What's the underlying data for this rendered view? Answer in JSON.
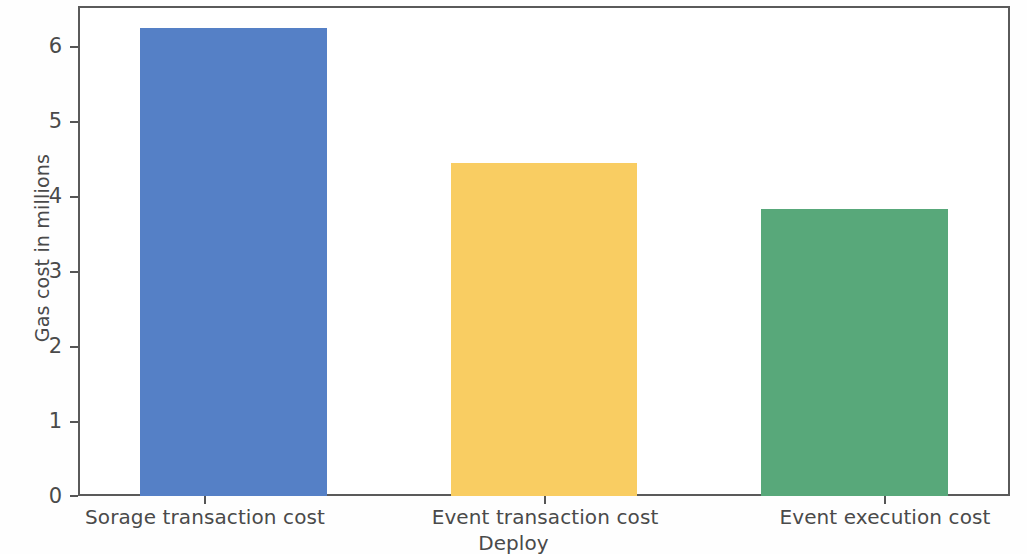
{
  "chart_data": {
    "type": "bar",
    "title": "",
    "subtitle": "",
    "categories": [
      "Sorage transaction cost",
      "Event transaction cost",
      "Event execution cost"
    ],
    "values": [
      6.25,
      4.45,
      3.83
    ],
    "xlabel": "Deploy",
    "ylabel": "Gas cost in millions",
    "ylim": [
      0,
      6.55
    ],
    "xlim": [
      0,
      3
    ],
    "yticks": [
      0,
      1,
      2,
      3,
      4,
      5,
      6
    ],
    "ytick_labels": [
      "0",
      "1",
      "2",
      "3",
      "4",
      "5",
      "6"
    ],
    "grid": false,
    "legend": false,
    "legend_position": "none",
    "bar_colors": [
      "#5580c6",
      "#f9cd62",
      "#58a87a"
    ],
    "bar_width_fraction": 0.6,
    "series": [
      {
        "name": "Gas cost in millions",
        "values": [
          6.25,
          4.45,
          3.83
        ]
      }
    ],
    "annotations": []
  },
  "axes": {
    "y_label": "Gas cost in millions",
    "x_label": "Deploy",
    "y_ticks": [
      {
        "label": "6",
        "value": 6
      },
      {
        "label": "5",
        "value": 5
      },
      {
        "label": "4",
        "value": 4
      },
      {
        "label": "3",
        "value": 3
      },
      {
        "label": "2",
        "value": 2
      },
      {
        "label": "1",
        "value": 1
      },
      {
        "label": "0",
        "value": 0
      }
    ],
    "x_ticks": [
      {
        "label": "Sorage transaction cost"
      },
      {
        "label": "Event transaction cost"
      },
      {
        "label": "Event execution cost"
      }
    ]
  },
  "style": {
    "frame_color": "#5a5a5a",
    "tick_color": "#555555",
    "text_color": "#4a4a4a",
    "background": "#ffffff",
    "bar_blue": "#5580c6",
    "bar_yellow": "#f9cd62",
    "bar_green": "#58a87a"
  }
}
